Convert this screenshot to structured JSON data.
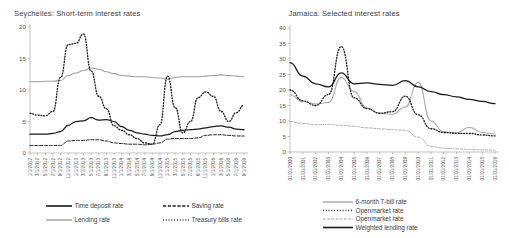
{
  "chart_data": [
    {
      "type": "line",
      "title": "Seychelles: Short-term interest rates",
      "xlabel": "",
      "ylabel": "",
      "ylim": [
        0,
        20
      ],
      "yticks": [
        0,
        5,
        10,
        15,
        20
      ],
      "grid": false,
      "legend_position": "bottom",
      "categories": [
        "1/1/2012",
        "3/1/2012",
        "5/1/2012",
        "7/1/2012",
        "9/1/2012",
        "11/1/2012",
        "1/1/2013",
        "3/1/2013",
        "5/1/2013",
        "7/1/2013",
        "9/1/2013",
        "11/1/2013",
        "1/1/2014",
        "3/1/2014",
        "5/1/2014",
        "7/1/2014",
        "9/1/2014",
        "11/1/2014",
        "1/1/2015",
        "3/1/2015",
        "5/1/2015",
        "7/1/2015",
        "9/1/2015",
        "11/1/2015",
        "1/1/2016",
        "3/1/2016",
        "5/1/2016",
        "7/1/2016",
        "9/1/2016"
      ],
      "series": [
        {
          "name": "Time deposit rate",
          "style": "solid-thick-black",
          "color": "#1a1a1a",
          "values": [
            3.0,
            3.0,
            3.0,
            3.1,
            3.4,
            4.4,
            5.0,
            5.1,
            5.6,
            5.2,
            5.3,
            5.0,
            4.2,
            3.6,
            3.2,
            3.0,
            2.8,
            2.7,
            2.9,
            3.4,
            3.6,
            3.7,
            3.8,
            4.0,
            4.2,
            4.3,
            4.1,
            3.8,
            3.7
          ]
        },
        {
          "name": "Saving rate",
          "style": "dashed-black",
          "color": "#1a1a1a",
          "values": [
            1.2,
            1.2,
            1.2,
            1.2,
            1.2,
            1.9,
            2.0,
            2.0,
            2.1,
            2.1,
            1.9,
            1.6,
            1.5,
            1.4,
            1.4,
            1.3,
            1.4,
            1.6,
            2.2,
            2.3,
            2.3,
            2.3,
            2.4,
            2.8,
            2.9,
            2.9,
            2.8,
            2.7,
            2.7
          ]
        },
        {
          "name": "Lending rate",
          "style": "solid-gray",
          "color": "#9e9e9e",
          "values": [
            11.3,
            11.3,
            11.4,
            11.4,
            11.5,
            12.3,
            12.7,
            13.1,
            13.5,
            13.3,
            12.9,
            12.6,
            12.3,
            12.2,
            12.1,
            12.1,
            12.0,
            11.9,
            11.7,
            12.0,
            12.1,
            12.1,
            12.1,
            12.2,
            12.3,
            12.4,
            12.3,
            12.2,
            12.1
          ]
        },
        {
          "name": "Treasury bills rate",
          "style": "dotted-black",
          "color": "#1a1a1a",
          "values": [
            6.3,
            6.0,
            5.9,
            6.6,
            12.0,
            17.2,
            17.4,
            18.9,
            13.0,
            9.0,
            7.0,
            4.3,
            3.6,
            2.9,
            2.3,
            1.6,
            1.4,
            4.5,
            12.2,
            7.2,
            3.2,
            5.0,
            8.8,
            9.7,
            9.0,
            6.6,
            5.0,
            6.4,
            7.6
          ]
        }
      ]
    },
    {
      "type": "line",
      "title": "Jamaica: Selected interest rates",
      "xlabel": "",
      "ylabel": "",
      "ylim": [
        0,
        40
      ],
      "yticks": [
        0,
        5,
        10,
        15,
        20,
        25,
        30,
        35,
        40
      ],
      "grid": false,
      "legend_position": "bottom",
      "categories": [
        "01/01/2000",
        "01/01/2001",
        "01/01/2002",
        "01/01/2003",
        "01/01/2004",
        "01/01/2005",
        "01/01/2006",
        "01/01/2007",
        "01/01/2008",
        "01/01/2009",
        "01/01/2010",
        "01/01/2011",
        "01/01/2012",
        "01/01/2013",
        "01/01/2014",
        "01/01/2015",
        "01/01/2016"
      ],
      "series": [
        {
          "name": "6-month T-bill rate",
          "style": "solid-gray",
          "color": "#a6a6a6",
          "values": [
            18.5,
            16.2,
            15.5,
            16.0,
            24.0,
            19.5,
            14.2,
            12.5,
            12.2,
            14.5,
            22.5,
            10.0,
            6.5,
            6.2,
            8.0,
            6.3,
            5.8
          ]
        },
        {
          "name": "Openmarket rate",
          "style": "dotted-black",
          "color": "#1a1a1a",
          "values": [
            20.0,
            16.5,
            15.0,
            18.5,
            34.0,
            17.5,
            14.0,
            12.5,
            13.0,
            18.0,
            12.0,
            7.5,
            6.3,
            6.0,
            6.0,
            5.5,
            5.2
          ]
        },
        {
          "name": "Openmarket rate",
          "style": "dashed-gray",
          "color": "#a0a0a0",
          "values": [
            9.8,
            9.2,
            8.8,
            8.9,
            8.6,
            8.3,
            7.8,
            7.5,
            7.2,
            7.0,
            4.8,
            1.8,
            1.2,
            1.0,
            0.8,
            0.7,
            0.6
          ]
        },
        {
          "name": "Weighted lending rate",
          "style": "solid-thick-black",
          "color": "#1a1a1a",
          "values": [
            28.8,
            24.5,
            22.0,
            21.0,
            25.5,
            22.0,
            22.3,
            21.8,
            21.5,
            23.0,
            21.0,
            19.5,
            18.5,
            17.8,
            17.0,
            16.3,
            15.6
          ]
        }
      ]
    }
  ]
}
